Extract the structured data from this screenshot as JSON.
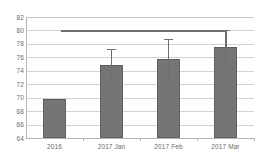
{
  "chart_data": {
    "type": "bar",
    "title": "",
    "xlabel": "",
    "ylabel": "",
    "categories": [
      "2016",
      "2017 Jan",
      "2017 Feb",
      "2017 Mar"
    ],
    "values": [
      69.8,
      74.8,
      75.7,
      77.6
    ],
    "errors": [
      null,
      2.5,
      3.0,
      2.4
    ],
    "error_upper": [
      null,
      77.3,
      78.7,
      80.0
    ],
    "error_lower": [
      null,
      72.3,
      72.7,
      75.2
    ],
    "ylim": [
      64,
      82
    ],
    "ytick_labels": [
      "82",
      "80",
      "78",
      "76",
      "74",
      "72",
      "70",
      "68",
      "66",
      "64"
    ],
    "ytick_values": [
      82,
      80,
      78,
      76,
      74,
      72,
      70,
      68,
      66,
      64
    ],
    "grid": true,
    "legend": "none",
    "bar_color": "#757575",
    "grid_color": "#d3d3d3",
    "axis_color": "#b5b5b5",
    "text_color": "#6b6b6b",
    "annotations": [
      {
        "type": "significance-bracket",
        "label": "",
        "y": 80.0,
        "from_category": "2016",
        "to_category": "2017 Mar"
      }
    ]
  }
}
